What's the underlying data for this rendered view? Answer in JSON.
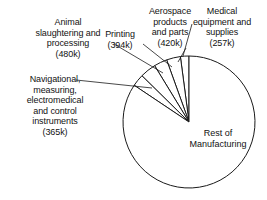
{
  "chart_data": {
    "type": "pie",
    "title": "",
    "units": "jobs",
    "center": [
      189,
      122
    ],
    "radius": 66,
    "start_angle_deg": 90,
    "direction": "counterclockwise",
    "legend": "none",
    "grid": false,
    "categories": [
      "Medical equipment and supplies",
      "Aerospace products and parts",
      "Printing",
      "Animal slaughtering and processing",
      "Navigational, measuring, electromedical and control instruments",
      "Rest of Manufacturing"
    ],
    "values": [
      257,
      420,
      394,
      480,
      365,
      10500
    ],
    "value_labels": [
      "257k",
      "420k",
      "394k",
      "480k",
      "365k",
      ""
    ],
    "slices": [
      {
        "name": "Medical equipment and supplies",
        "value": 257,
        "label": "257k",
        "a0": 90,
        "a1": 97.5
      },
      {
        "name": "Aerospace products and parts",
        "value": 420,
        "label": "420k",
        "a0": 97.5,
        "a1": 109.8
      },
      {
        "name": "Printing",
        "value": 394,
        "label": "394k",
        "a0": 109.8,
        "a1": 121.4
      },
      {
        "name": "Animal slaughtering and processing",
        "value": 480,
        "label": "480k",
        "a0": 121.4,
        "a1": 135.5
      },
      {
        "name": "Navigational, measuring, electromedical and control instruments",
        "value": 365,
        "label": "365k",
        "a0": 135.5,
        "a1": 146.2
      },
      {
        "name": "Rest of Manufacturing",
        "value": 10500,
        "label": "",
        "a0": 146.2,
        "a1": 450
      }
    ]
  },
  "labels": {
    "animal": "Animal\nslaughtering and\nprocessing\n(480k)",
    "printing": "Printing\n(394k)",
    "aerospace": "Aerospace\nproducts\nand parts\n(420k)",
    "medical": "Medical\nequipment and\nsupplies\n(257k)",
    "navigational": "Navigational,\nmeasuring,\nelectromedical\nand control\ninstruments\n(365k)",
    "rest": "Rest of\nManufacturing"
  },
  "colors": {
    "background": "#ffffff",
    "stroke": "#1a1a1a",
    "fill": "#ffffff",
    "text": "#121212"
  }
}
